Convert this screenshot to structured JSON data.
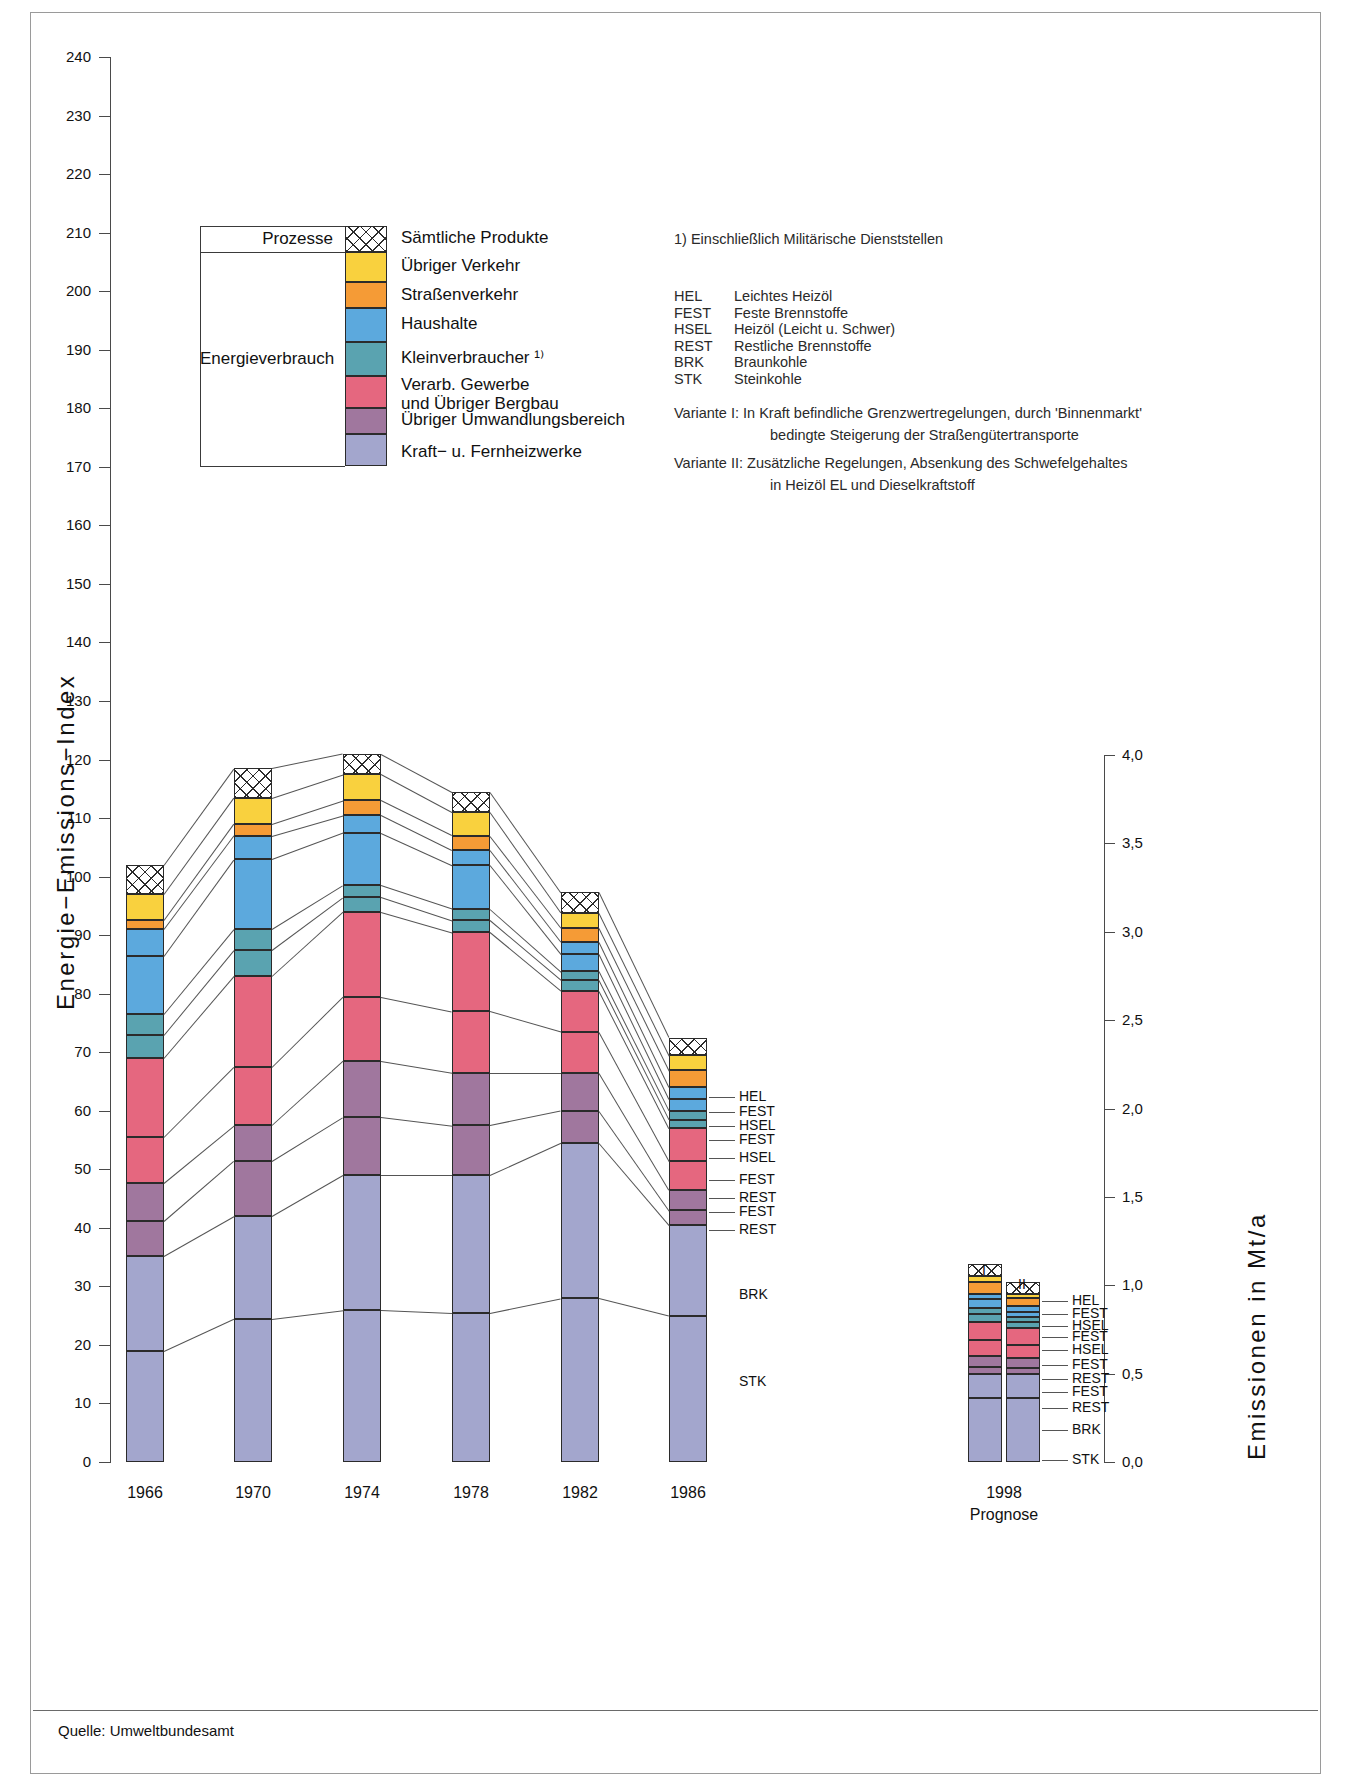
{
  "meta": {
    "source_label": "Quelle: Umweltbundesamt",
    "y_axis_left_title": "Energie−Emissions−Index",
    "y_axis_right_title": "Emissionen in Mt/a"
  },
  "axes": {
    "left_ticks": [
      "240",
      "230",
      "220",
      "210",
      "200",
      "190",
      "180",
      "170",
      "160",
      "150",
      "140",
      "130",
      "120",
      "110",
      "100",
      "90",
      "80",
      "70",
      "60",
      "50",
      "40",
      "30",
      "20",
      "10",
      "0"
    ],
    "left_min": 0,
    "left_max": 240,
    "right_ticks": [
      "4,0",
      "3,5",
      "3,0",
      "2,5",
      "2,0",
      "1,5",
      "1,0",
      "0,5",
      "0,0"
    ],
    "right_min": 0.0,
    "right_max": 4.0
  },
  "legend": {
    "group_top_label": "Prozesse",
    "group_bottom_label": "Energieverbrauch",
    "items": [
      {
        "label": "Sämtliche Produkte",
        "color": "#ffffff",
        "pattern": "hatch"
      },
      {
        "label": "Übriger Verkehr",
        "color": "#f9d13e",
        "pattern": "solid"
      },
      {
        "label": "Straßenverkehr",
        "color": "#f59b36",
        "pattern": "solid"
      },
      {
        "label": "Haushalte",
        "color": "#5ca9dd",
        "pattern": "solid"
      },
      {
        "label": "Kleinverbraucher ¹⁾",
        "color": "#5aa3b0",
        "pattern": "solid"
      },
      {
        "label": "Verarb. Gewerbe\nund Übriger Bergbau",
        "color": "#e5677f",
        "pattern": "solid"
      },
      {
        "label": "Übriger Umwandlungsbereich",
        "color": "#a0779e",
        "pattern": "solid"
      },
      {
        "label": "Kraft− u. Fernheizwerke",
        "color": "#a3a6cd",
        "pattern": "solid"
      }
    ]
  },
  "notes": {
    "footnote1": "1) Einschließlich Militärische Dienststellen",
    "abbreviations": [
      {
        "key": "HEL",
        "value": "Leichtes Heizöl"
      },
      {
        "key": "FEST",
        "value": "Feste Brennstoffe"
      },
      {
        "key": "HSEL",
        "value": "Heizöl (Leicht u. Schwer)"
      },
      {
        "key": "REST",
        "value": "Restliche Brennstoffe"
      },
      {
        "key": "BRK",
        "value": "Braunkohle"
      },
      {
        "key": "STK",
        "value": "Steinkohle"
      }
    ],
    "variant1_line1": "Variante I:  In Kraft befindliche Grenzwertregelungen, durch 'Binnenmarkt'",
    "variant1_line2": "bedingte Steigerung der Straßengütertransporte",
    "variant2_line1": "Variante II: Zusätzliche Regelungen, Absenkung des Schwefelgehaltes",
    "variant2_line2": "in Heizöl EL und Dieselkraftstoff"
  },
  "fuel_labels_main": [
    "HEL",
    "FEST",
    "HSEL",
    "FEST",
    "HSEL",
    "FEST",
    "REST",
    "FEST",
    "REST",
    "BRK",
    "STK"
  ],
  "fuel_labels_prognose": [
    "HEL",
    "FEST",
    "HSEL",
    "FEST",
    "HSEL",
    "FEST",
    "REST",
    "FEST",
    "REST",
    "BRK",
    "STK"
  ],
  "prognose": {
    "year_label": "1998",
    "caption": "Prognose",
    "variant_i": "I",
    "variant_ii": "II"
  },
  "chart_data": {
    "type": "bar",
    "title": "",
    "xlabel": "",
    "ylabel": "Energie−Emissions−Index",
    "ylabel_right": "Emissionen in Mt/a",
    "ylim": [
      0,
      240
    ],
    "ylim_right": [
      0.0,
      4.0
    ],
    "grid": false,
    "legend_position": "top-left",
    "categories": [
      "1966",
      "1970",
      "1974",
      "1978",
      "1982",
      "1986"
    ],
    "stack_order_bottom_to_top": [
      "Kraft- u. Fernheizwerke (STK)",
      "Kraft- u. Fernheizwerke (BRK)",
      "Übriger Umwandlungsbereich (REST)",
      "Übriger Umwandlungsbereich (FEST)",
      "Verarb. Gewerbe und Übriger Bergbau (REST)",
      "Verarb. Gewerbe und Übriger Bergbau (FEST)",
      "Kleinverbraucher (HSEL)",
      "Kleinverbraucher (FEST)",
      "Haushalte (HSEL)",
      "Haushalte (FEST)",
      "Straßenverkehr (HEL)",
      "Übriger Verkehr",
      "Prozesse – Sämtliche Produkte"
    ],
    "series": [
      {
        "name": "Kraft- u. Fernheizwerke (STK)",
        "color": "#a3a6cd",
        "pattern": "solid",
        "values": [
          19.0,
          24.5,
          26.0,
          25.5,
          28.0,
          25.0
        ]
      },
      {
        "name": "Kraft- u. Fernheizwerke (BRK)",
        "color": "#a3a6cd",
        "pattern": "solid",
        "values": [
          16.2,
          17.5,
          23.0,
          23.5,
          26.5,
          15.5
        ]
      },
      {
        "name": "Übriger Umwandlungsbereich (REST)",
        "color": "#a0779e",
        "pattern": "solid",
        "values": [
          6.0,
          9.5,
          10.0,
          8.5,
          5.5,
          2.5
        ]
      },
      {
        "name": "Übriger Umwandlungsbereich (FEST)",
        "color": "#a0779e",
        "pattern": "solid",
        "values": [
          6.5,
          6.0,
          9.5,
          9.0,
          6.5,
          3.5
        ]
      },
      {
        "name": "Verarb. Gewerbe und Übriger Bergbau (REST)",
        "color": "#e5677f",
        "pattern": "solid",
        "values": [
          7.8,
          10.0,
          11.0,
          10.5,
          7.0,
          5.0
        ]
      },
      {
        "name": "Verarb. Gewerbe und Übriger Bergbau (FEST)",
        "color": "#e5677f",
        "pattern": "solid",
        "values": [
          13.5,
          15.5,
          14.5,
          13.5,
          7.0,
          5.5
        ]
      },
      {
        "name": "Kleinverbraucher (HSEL)",
        "color": "#5aa3b0",
        "pattern": "solid",
        "values": [
          4.0,
          4.5,
          2.5,
          2.0,
          1.8,
          1.5
        ]
      },
      {
        "name": "Kleinverbraucher (FEST)",
        "color": "#5aa3b0",
        "pattern": "solid",
        "values": [
          3.5,
          3.5,
          2.0,
          2.0,
          1.5,
          1.5
        ]
      },
      {
        "name": "Haushalte (HSEL)",
        "color": "#5ca9dd",
        "pattern": "solid",
        "values": [
          10.0,
          12.0,
          9.0,
          7.5,
          3.0,
          2.0
        ]
      },
      {
        "name": "Haushalte (FEST)",
        "color": "#5ca9dd",
        "pattern": "solid",
        "values": [
          4.5,
          4.0,
          3.0,
          2.5,
          2.0,
          2.0
        ]
      },
      {
        "name": "Straßenverkehr (HEL)",
        "color": "#f59b36",
        "pattern": "solid",
        "values": [
          1.5,
          2.0,
          2.5,
          2.5,
          2.5,
          3.0
        ]
      },
      {
        "name": "Übriger Verkehr",
        "color": "#f9d13e",
        "pattern": "solid",
        "values": [
          4.5,
          4.5,
          4.5,
          4.0,
          2.5,
          2.5
        ]
      },
      {
        "name": "Prozesse – Sämtliche Produkte",
        "color": "#ffffff",
        "pattern": "hatch",
        "values": [
          5.0,
          5.0,
          3.5,
          3.5,
          3.5,
          3.0
        ]
      }
    ],
    "totals": [
      102.0,
      113.5,
      110.5,
      104.5,
      87.3,
      70.5
    ],
    "prognose_bars": [
      {
        "name": "1998 Variante I",
        "total_mt": 1.12,
        "segments": [
          {
            "name": "Kraft- u. Fernheizwerke (STK)",
            "color": "#a3a6cd",
            "pattern": "solid",
            "value": 0.36
          },
          {
            "name": "Kraft- u. Fernheizwerke (BRK)",
            "color": "#a3a6cd",
            "pattern": "solid",
            "value": 0.14
          },
          {
            "name": "Übriger Umwandlungsbereich (REST)",
            "color": "#a0779e",
            "pattern": "solid",
            "value": 0.04
          },
          {
            "name": "Übriger Umwandlungsbereich (FEST)",
            "color": "#a0779e",
            "pattern": "solid",
            "value": 0.06
          },
          {
            "name": "Verarb. Gewerbe (REST)",
            "color": "#e5677f",
            "pattern": "solid",
            "value": 0.09
          },
          {
            "name": "Verarb. Gewerbe (FEST)",
            "color": "#e5677f",
            "pattern": "solid",
            "value": 0.1
          },
          {
            "name": "Kleinverbraucher (HSEL)",
            "color": "#5aa3b0",
            "pattern": "solid",
            "value": 0.05
          },
          {
            "name": "Kleinverbraucher (FEST)",
            "color": "#5aa3b0",
            "pattern": "solid",
            "value": 0.03
          },
          {
            "name": "Haushalte (HSEL)",
            "color": "#5ca9dd",
            "pattern": "solid",
            "value": 0.05
          },
          {
            "name": "Haushalte (FEST)",
            "color": "#5ca9dd",
            "pattern": "solid",
            "value": 0.03
          },
          {
            "name": "Straßenverkehr (HEL)",
            "color": "#f59b36",
            "pattern": "solid",
            "value": 0.07
          },
          {
            "name": "Übriger Verkehr",
            "color": "#f9d13e",
            "pattern": "solid",
            "value": 0.03
          },
          {
            "name": "Prozesse",
            "color": "#ffffff",
            "pattern": "hatch",
            "value": 0.07
          }
        ]
      },
      {
        "name": "1998 Variante II",
        "total_mt": 1.02,
        "segments": [
          {
            "name": "Kraft- u. Fernheizwerke (STK)",
            "color": "#a3a6cd",
            "pattern": "solid",
            "value": 0.36
          },
          {
            "name": "Kraft- u. Fernheizwerke (BRK)",
            "color": "#a3a6cd",
            "pattern": "solid",
            "value": 0.14
          },
          {
            "name": "Übriger Umwandlungsbereich (REST)",
            "color": "#a0779e",
            "pattern": "solid",
            "value": 0.03
          },
          {
            "name": "Übriger Umwandlungsbereich (FEST)",
            "color": "#a0779e",
            "pattern": "solid",
            "value": 0.06
          },
          {
            "name": "Verarb. Gewerbe (REST)",
            "color": "#e5677f",
            "pattern": "solid",
            "value": 0.07
          },
          {
            "name": "Verarb. Gewerbe (FEST)",
            "color": "#e5677f",
            "pattern": "solid",
            "value": 0.1
          },
          {
            "name": "Kleinverbraucher (HSEL)",
            "color": "#5aa3b0",
            "pattern": "solid",
            "value": 0.03
          },
          {
            "name": "Kleinverbraucher (FEST)",
            "color": "#5aa3b0",
            "pattern": "solid",
            "value": 0.03
          },
          {
            "name": "Haushalte (HSEL)",
            "color": "#5ca9dd",
            "pattern": "solid",
            "value": 0.03
          },
          {
            "name": "Haushalte (FEST)",
            "color": "#5ca9dd",
            "pattern": "solid",
            "value": 0.03
          },
          {
            "name": "Straßenverkehr (HEL)",
            "color": "#f59b36",
            "pattern": "solid",
            "value": 0.05
          },
          {
            "name": "Übriger Verkehr",
            "color": "#f9d13e",
            "pattern": "solid",
            "value": 0.02
          },
          {
            "name": "Prozesse",
            "color": "#ffffff",
            "pattern": "hatch",
            "value": 0.07
          }
        ]
      }
    ]
  }
}
